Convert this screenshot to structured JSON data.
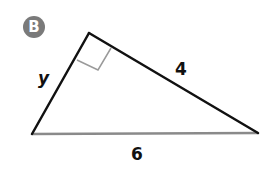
{
  "figure": {
    "badge_label": "B",
    "labels": {
      "left_side": "y",
      "right_side": "4",
      "base": "6"
    },
    "colors": {
      "badge": "#7a7a7a",
      "sides": "#111111",
      "base": "#8a8a8a",
      "right_angle_marker": "#9a9a9a"
    },
    "right_angle_at": "apex"
  }
}
